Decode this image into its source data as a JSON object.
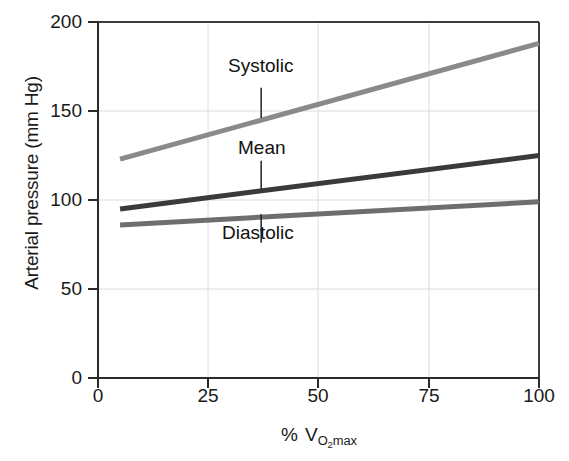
{
  "chart_data": {
    "type": "line",
    "title": "",
    "xlabel": "% VO2max",
    "xlabel_parts": {
      "percent": "%",
      "v": "V",
      "o": "O",
      "two": "2",
      "max": "max"
    },
    "ylabel": "Arterial pressure (mm Hg)",
    "xlim": [
      0,
      100
    ],
    "ylim": [
      0,
      200
    ],
    "xticks": [
      0,
      25,
      50,
      75,
      100
    ],
    "xtick_labels": [
      "0",
      "25",
      "50",
      "75",
      "100"
    ],
    "yticks": [
      0,
      50,
      100,
      150,
      200
    ],
    "ytick_labels": [
      "0",
      "50",
      "100",
      "150",
      "200"
    ],
    "grid": true,
    "grid_color": "#d9d9d9",
    "legend": "inline-annotations",
    "series": [
      {
        "name": "Systolic",
        "label": "Systolic",
        "color": "#8a8a8a",
        "x": [
          5,
          100
        ],
        "values": [
          123,
          188
        ]
      },
      {
        "name": "Mean",
        "label": "Mean",
        "color": "#3a3a3a",
        "x": [
          5,
          100
        ],
        "values": [
          95,
          125
        ]
      },
      {
        "name": "Diastolic",
        "label": "Diastolic",
        "color": "#6e6e6e",
        "x": [
          5,
          100
        ],
        "values": [
          86,
          99
        ]
      }
    ],
    "annotations": [
      {
        "text": "Systolic",
        "x": 37,
        "y": 163,
        "leader_to_y": 146
      },
      {
        "text": "Mean",
        "x": 37,
        "y": 122,
        "leader_to_y": 106
      },
      {
        "text": "Diastolic",
        "x": 37,
        "y": 76,
        "leader_to_y": 92
      }
    ]
  },
  "axes": {
    "ylabel": "Arterial pressure (mm Hg)",
    "ytick_0": "0",
    "ytick_50": "50",
    "ytick_100": "100",
    "ytick_150": "150",
    "ytick_200": "200",
    "xtick_0": "0",
    "xtick_25": "25",
    "xtick_50": "50",
    "xtick_75": "75",
    "xtick_100": "100"
  },
  "annotations": {
    "systolic": "Systolic",
    "mean": "Mean",
    "diastolic": "Diastolic"
  },
  "xlabel": {
    "percent": "%",
    "v": "V",
    "o": "O",
    "two": "2",
    "max": "max"
  }
}
